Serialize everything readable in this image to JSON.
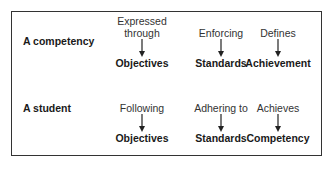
{
  "rows": [
    {
      "subject": "A competency",
      "relations": [
        {
          "verb": "Expressed through",
          "verb_lines": [
            "Expressed",
            "through"
          ],
          "target": "Objectives"
        },
        {
          "verb": "Enforcing",
          "verb_lines": [
            "Enforcing"
          ],
          "target": "Standards"
        },
        {
          "verb": "Defines",
          "verb_lines": [
            "Defines"
          ],
          "target": "Achievement"
        }
      ]
    },
    {
      "subject": "A student",
      "relations": [
        {
          "verb": "Following",
          "verb_lines": [
            "Following"
          ],
          "target": "Objectives"
        },
        {
          "verb": "Adhering to",
          "verb_lines": [
            "Adhering to"
          ],
          "target": "Standards"
        },
        {
          "verb": "Achieves",
          "verb_lines": [
            "Achieves"
          ],
          "target": "Competency"
        }
      ]
    }
  ],
  "arrow_icon": "down-arrow"
}
